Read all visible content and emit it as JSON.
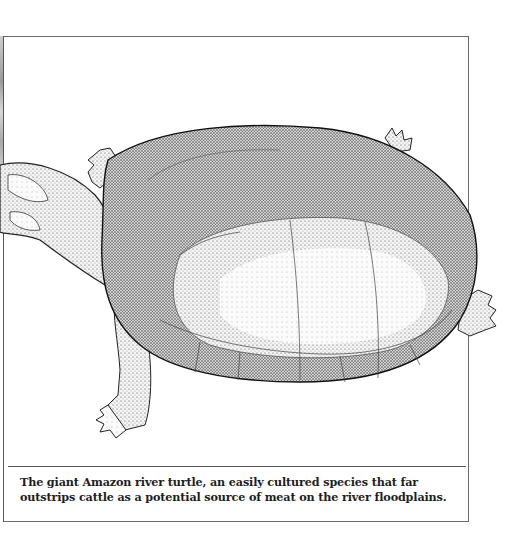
{
  "figure": {
    "icon": "turtle-illustration"
  },
  "caption": {
    "text": "The giant Amazon river turtle, an easily cultured species that far outstrips cattle as a potential source of meat on the river floodplains."
  },
  "colors": {
    "frame": "#6a6a6a",
    "text": "#1e1e1e",
    "background": "#ffffff"
  }
}
